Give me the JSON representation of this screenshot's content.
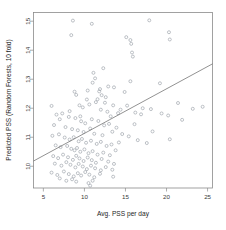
{
  "chart_data": {
    "type": "scatter",
    "title": "",
    "xlabel": "Avg. PSS per day",
    "ylabel": "Predicted PSS (Random Forests, 10 fold)",
    "xlim": [
      3.8,
      25.6
    ],
    "ylim": [
      9.25,
      15.3
    ],
    "xticks": [
      5,
      10,
      15,
      20,
      25
    ],
    "xtick_labels": [
      "5",
      "10",
      "15",
      "20",
      "25"
    ],
    "yticks": [
      10,
      11,
      12,
      13,
      14,
      15
    ],
    "ytick_labels": [
      "10",
      "11",
      "12",
      "13",
      "14",
      "15"
    ],
    "grid": false,
    "legend": null,
    "marker": "open-circle",
    "marker_color": "#9aa0a8",
    "line_color": "#6e6e6e",
    "frame_color": "#8a8a8a",
    "background": "#ffffff",
    "trendline": {
      "type": "linear",
      "x": [
        3.8,
        25.6
      ],
      "y": [
        10.18,
        13.53
      ],
      "slope": 0.1537,
      "intercept": 9.596
    },
    "points": [
      [
        8.6,
        15.02
      ],
      [
        17.9,
        15.03
      ],
      [
        8.4,
        14.52
      ],
      [
        10.9,
        14.91
      ],
      [
        20.3,
        14.62
      ],
      [
        20.4,
        14.37
      ],
      [
        15.1,
        14.45
      ],
      [
        15.7,
        14.22
      ],
      [
        15.6,
        14.35
      ],
      [
        15.8,
        13.92
      ],
      [
        15.9,
        13.78
      ],
      [
        12.3,
        13.38
      ],
      [
        11.1,
        13.22
      ],
      [
        11.3,
        13.03
      ],
      [
        15.6,
        12.93
      ],
      [
        19.2,
        12.86
      ],
      [
        12.9,
        12.75
      ],
      [
        13.6,
        12.72
      ],
      [
        14.9,
        12.56
      ],
      [
        11.0,
        12.88
      ],
      [
        10.4,
        12.61
      ],
      [
        11.8,
        12.58
      ],
      [
        12.1,
        12.45
      ],
      [
        8.8,
        12.57
      ],
      [
        9.0,
        12.46
      ],
      [
        10.3,
        12.3
      ],
      [
        11.6,
        12.31
      ],
      [
        12.5,
        12.19
      ],
      [
        13.5,
        12.1
      ],
      [
        15.2,
        12.09
      ],
      [
        17.1,
        12.0
      ],
      [
        18.1,
        11.97
      ],
      [
        21.4,
        12.18
      ],
      [
        24.4,
        12.05
      ],
      [
        23.2,
        11.98
      ],
      [
        6.0,
        12.08
      ],
      [
        9.4,
        12.1
      ],
      [
        9.8,
        12.03
      ],
      [
        10.6,
        12.13
      ],
      [
        11.4,
        12.21
      ],
      [
        12.0,
        11.95
      ],
      [
        12.8,
        11.88
      ],
      [
        13.2,
        11.72
      ],
      [
        14.1,
        11.83
      ],
      [
        16.2,
        11.85
      ],
      [
        16.9,
        11.79
      ],
      [
        20.2,
        11.75
      ],
      [
        21.9,
        11.6
      ],
      [
        6.6,
        11.78
      ],
      [
        7.3,
        11.82
      ],
      [
        7.0,
        11.62
      ],
      [
        8.1,
        11.7
      ],
      [
        8.9,
        11.66
      ],
      [
        9.6,
        11.55
      ],
      [
        10.1,
        11.48
      ],
      [
        10.9,
        11.62
      ],
      [
        11.7,
        11.56
      ],
      [
        12.4,
        11.41
      ],
      [
        13.0,
        11.46
      ],
      [
        13.9,
        11.33
      ],
      [
        6.3,
        11.42
      ],
      [
        7.7,
        11.35
      ],
      [
        8.5,
        11.28
      ],
      [
        9.2,
        11.24
      ],
      [
        9.9,
        11.18
      ],
      [
        10.7,
        11.3
      ],
      [
        11.2,
        11.12
      ],
      [
        12.2,
        11.07
      ],
      [
        13.4,
        11.19
      ],
      [
        14.6,
        11.11
      ],
      [
        15.4,
        11.03
      ],
      [
        16.5,
        10.9
      ],
      [
        18.3,
        11.2
      ],
      [
        20.4,
        10.93
      ],
      [
        6.1,
        11.05
      ],
      [
        6.9,
        11.1
      ],
      [
        7.6,
        10.99
      ],
      [
        8.2,
        10.92
      ],
      [
        8.7,
        11.0
      ],
      [
        9.3,
        10.86
      ],
      [
        9.7,
        10.94
      ],
      [
        10.2,
        10.81
      ],
      [
        10.8,
        10.88
      ],
      [
        11.5,
        10.77
      ],
      [
        12.0,
        10.84
      ],
      [
        12.7,
        10.7
      ],
      [
        13.3,
        10.75
      ],
      [
        14.2,
        10.82
      ],
      [
        17.6,
        10.8
      ],
      [
        6.5,
        10.72
      ],
      [
        7.1,
        10.66
      ],
      [
        7.9,
        10.7
      ],
      [
        8.4,
        10.6
      ],
      [
        8.8,
        10.55
      ],
      [
        9.1,
        10.63
      ],
      [
        9.5,
        10.5
      ],
      [
        10.0,
        10.58
      ],
      [
        10.5,
        10.45
      ],
      [
        11.0,
        10.52
      ],
      [
        11.6,
        10.4
      ],
      [
        12.3,
        10.47
      ],
      [
        13.1,
        10.38
      ],
      [
        13.8,
        10.55
      ],
      [
        6.2,
        10.35
      ],
      [
        6.8,
        10.28
      ],
      [
        7.4,
        10.4
      ],
      [
        8.0,
        10.31
      ],
      [
        8.6,
        10.22
      ],
      [
        9.0,
        10.36
      ],
      [
        9.4,
        10.27
      ],
      [
        9.9,
        10.18
      ],
      [
        10.4,
        10.3
      ],
      [
        10.9,
        10.21
      ],
      [
        11.4,
        10.12
      ],
      [
        12.1,
        10.25
      ],
      [
        12.9,
        10.16
      ],
      [
        13.6,
        10.08
      ],
      [
        6.4,
        10.09
      ],
      [
        7.2,
        10.02
      ],
      [
        7.8,
        10.14
      ],
      [
        8.3,
        10.05
      ],
      [
        8.9,
        9.96
      ],
      [
        9.3,
        10.08
      ],
      [
        9.8,
        9.99
      ],
      [
        10.3,
        9.9
      ],
      [
        10.8,
        10.02
      ],
      [
        11.3,
        9.93
      ],
      [
        12.0,
        9.86
      ],
      [
        12.6,
        9.97
      ],
      [
        13.4,
        9.88
      ],
      [
        6.0,
        9.78
      ],
      [
        6.7,
        9.7
      ],
      [
        7.5,
        9.82
      ],
      [
        8.1,
        9.73
      ],
      [
        8.7,
        9.65
      ],
      [
        9.2,
        9.76
      ],
      [
        9.6,
        9.68
      ],
      [
        10.1,
        9.8
      ],
      [
        10.6,
        9.71
      ],
      [
        11.2,
        9.62
      ],
      [
        11.9,
        9.74
      ],
      [
        13.5,
        9.64
      ],
      [
        7.0,
        9.58
      ],
      [
        7.8,
        9.5
      ],
      [
        8.5,
        9.55
      ],
      [
        9.0,
        9.47
      ],
      [
        10.5,
        9.42
      ],
      [
        11.0,
        9.5
      ],
      [
        10.7,
        9.33
      ],
      [
        8.2,
        11.9
      ],
      [
        9.5,
        11.72
      ],
      [
        11.9,
        12.66
      ],
      [
        12.6,
        12.38
      ],
      [
        14.4,
        11.95
      ],
      [
        16.1,
        11.45
      ],
      [
        19.4,
        11.82
      ]
    ]
  }
}
